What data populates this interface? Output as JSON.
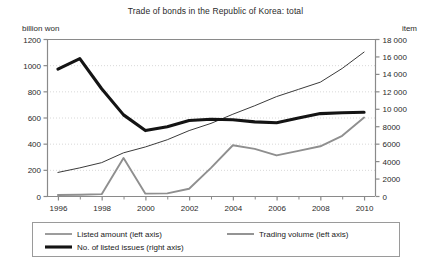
{
  "chart_data": {
    "type": "line",
    "title": "Trade of bonds in the Republic of Korea: total",
    "xlabel": "",
    "ylabel": "billion won",
    "ylabel_right": "item",
    "grid": true,
    "legend_position": "bottom",
    "x": [
      1996,
      1997,
      1998,
      1999,
      2000,
      2001,
      2002,
      2003,
      2004,
      2005,
      2006,
      2007,
      2008,
      2009,
      2010
    ],
    "xlim": [
      1995.5,
      2010.5
    ],
    "xticks": [
      1996,
      1998,
      2000,
      2002,
      2004,
      2006,
      2008,
      2010
    ],
    "xticklabels": [
      "1996",
      "1998",
      "2000",
      "2002",
      "2004",
      "2006",
      "2008",
      "2010"
    ],
    "xminorticks": [
      1997,
      1999,
      2001,
      2003,
      2005,
      2007,
      2009
    ],
    "ylim": [
      0,
      1200
    ],
    "yticks": [
      0,
      200,
      400,
      600,
      800,
      1000,
      1200
    ],
    "yticklabels": [
      "0",
      "200",
      "400",
      "600",
      "800",
      "1000",
      "1200"
    ],
    "ylim_right": [
      0,
      18000
    ],
    "yticks_right": [
      0,
      2000,
      4000,
      6000,
      8000,
      10000,
      12000,
      14000,
      16000,
      18000
    ],
    "yticklabels_right": [
      "0",
      "2000",
      "4000",
      "6000",
      "8000",
      "10 000",
      "12 000",
      "14 000",
      "16 000",
      "18 000"
    ],
    "series": [
      {
        "name": "Listed amount (left axis)",
        "axis": "left",
        "color": "#3b3b3b",
        "width": 1.0,
        "values": [
          180,
          215,
          255,
          330,
          375,
          430,
          500,
          555,
          625,
          690,
          760,
          815,
          870,
          975,
          1100
        ]
      },
      {
        "name": "Trading volume (left axis)",
        "axis": "left",
        "color": "#8f8f8f",
        "width": 1.9,
        "values": [
          8,
          10,
          14,
          290,
          18,
          20,
          55,
          215,
          388,
          360,
          310,
          345,
          380,
          460,
          600
        ]
      },
      {
        "name": "No. of listed issues (right axis)",
        "axis": "right",
        "color": "#141414",
        "width": 3.1,
        "values": [
          14550,
          15750,
          12300,
          9300,
          7500,
          7950,
          8650,
          8800,
          8750,
          8500,
          8400,
          8950,
          9450,
          9550,
          9600
        ]
      }
    ],
    "legend": [
      {
        "label": "Listed amount (left axis)",
        "color": "#3b3b3b",
        "width": 1.0
      },
      {
        "label": "Trading volume (left axis)",
        "color": "#8f8f8f",
        "width": 1.9
      },
      {
        "label": "No. of listed issues (right axis)",
        "color": "#141414",
        "width": 3.1
      }
    ],
    "colors": {
      "axis": "#8a8a8a",
      "grid": "#d8d8d8",
      "frame": "#8a8a8a",
      "legend_border": "#9a9a9a",
      "text": "#2a2a2a",
      "background": "#ffffff"
    }
  }
}
